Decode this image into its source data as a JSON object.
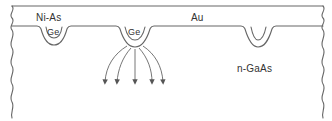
{
  "diagram": {
    "labels": {
      "contact_metal": "Ni-As",
      "top_metal": "Au",
      "ge_left": "Ge",
      "ge_middle": "Ge",
      "substrate": "n-GaAs"
    },
    "elements": {
      "layer_top": "Au layer",
      "pockets": [
        "Ge pocket left",
        "Ge pocket middle",
        "alloyed pocket right"
      ],
      "current_arrows": 5
    },
    "colors": {
      "line": "#555555",
      "background": "#ffffff"
    }
  }
}
